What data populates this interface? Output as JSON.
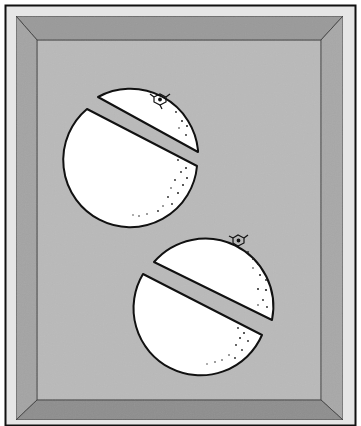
{
  "illustration": {
    "subject": "two oranges cut in half inside a beveled frame",
    "colors": {
      "background": "#ffffff",
      "outer_border": "#111111",
      "mat": "#e6e6e6",
      "bevel_top": "#9a9a9a",
      "bevel_left": "#a4a4a4",
      "bevel_right": "#a8a8a8",
      "bevel_bottom": "#8e8e8e",
      "panel": "#b9b9b9",
      "orange_fill": "#ffffff",
      "outline": "#111111"
    },
    "frame": {
      "outer": [
        5,
        5,
        351,
        421
      ],
      "bevel_outer": [
        16,
        16,
        343,
        420
      ],
      "panel": [
        37,
        40,
        321,
        400
      ]
    },
    "oranges": [
      {
        "name": "orange-top",
        "cx": 143,
        "cy": 148,
        "r": 80,
        "cut_angle_deg": 27
      },
      {
        "name": "orange-bottom",
        "cx": 225,
        "cy": 318,
        "r": 80,
        "cut_angle_deg": 27
      }
    ]
  }
}
